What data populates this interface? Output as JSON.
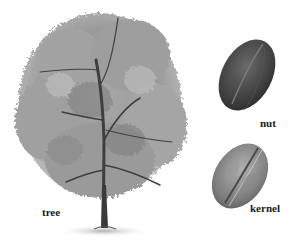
{
  "illustration": {
    "subject": "pecan",
    "parts": [
      {
        "id": "tree",
        "label": "tree"
      },
      {
        "id": "nut",
        "label": "nut"
      },
      {
        "id": "kernel",
        "label": "kernel"
      }
    ]
  },
  "colors": {
    "background": "#ffffff",
    "foliage_light": "#b9b9b9",
    "foliage_mid": "#8f8f8f",
    "foliage_dark": "#5a5a5a",
    "trunk": "#3a3a3a",
    "nut_shell": "#4a4a4a",
    "kernel": "#8a8a8a",
    "label_text": "#1a1a1a"
  }
}
